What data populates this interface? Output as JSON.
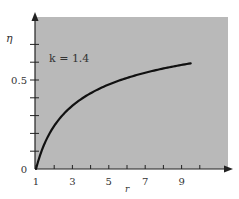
{
  "chart_data": {
    "type": "line",
    "title": "",
    "annotation": "k = 1.4",
    "xlabel": "r",
    "ylabel": "η",
    "x_ticks": [
      1,
      2,
      3,
      4,
      5,
      6,
      7,
      8,
      9,
      10
    ],
    "x_tick_labels": [
      "1",
      "3",
      "5",
      "7",
      "9"
    ],
    "x_tick_label_values": [
      1,
      3,
      5,
      7,
      9
    ],
    "y_ticks": [
      0,
      0.1,
      0.2,
      0.3,
      0.4,
      0.5,
      0.6,
      0.7
    ],
    "y_tick_labels": [
      "0",
      "0.5"
    ],
    "y_tick_label_values": [
      0,
      0.5
    ],
    "xlim": [
      1,
      10.8
    ],
    "ylim": [
      0,
      0.85
    ],
    "grid": false,
    "legend": "none",
    "series": [
      {
        "name": "η = 1 − r^(1−k), k = 1.4",
        "x": [
          1,
          1.5,
          2,
          2.5,
          3,
          4,
          5,
          6,
          7,
          8,
          9,
          9.5
        ],
        "values": [
          0,
          0.15,
          0.242,
          0.307,
          0.356,
          0.426,
          0.475,
          0.512,
          0.541,
          0.565,
          0.585,
          0.594
        ]
      }
    ],
    "colors": {
      "plot_bg": "#b9b9b9",
      "curve": "#111111",
      "axis": "#222222"
    }
  }
}
